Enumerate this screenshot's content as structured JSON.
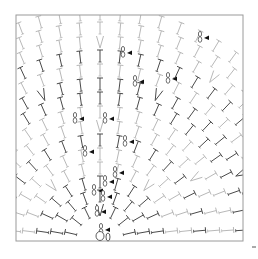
{
  "diagram": {
    "title": "Crochet stitch chart",
    "type": "radial crochet chart quarter",
    "frame": {
      "x": 16,
      "y": 15,
      "width": 227,
      "height": 226,
      "color": "#9a9a9a"
    },
    "center": {
      "x": 100,
      "y": 240
    },
    "colors": {
      "stitch_dark": "#4a4a4a",
      "stitch_light": "#b8b8b8",
      "marker": "#111111",
      "background": "#ffffff"
    },
    "rows": [
      {
        "radius": 24,
        "count": 7,
        "tone": "dark"
      },
      {
        "radius": 38,
        "count": 9,
        "tone": "dark"
      },
      {
        "radius": 52,
        "count": 11,
        "tone": "dark"
      },
      {
        "radius": 66,
        "count": 13,
        "tone": "light"
      },
      {
        "radius": 80,
        "count": 15,
        "tone": "light"
      },
      {
        "radius": 94,
        "count": 17,
        "tone": "dark"
      },
      {
        "radius": 108,
        "count": 19,
        "tone": "light"
      },
      {
        "radius": 122,
        "count": 21,
        "tone": "light"
      },
      {
        "radius": 136,
        "count": 23,
        "tone": "dark"
      },
      {
        "radius": 150,
        "count": 25,
        "tone": "dark"
      },
      {
        "radius": 164,
        "count": 27,
        "tone": "light"
      },
      {
        "radius": 178,
        "count": 29,
        "tone": "dark"
      },
      {
        "radius": 192,
        "count": 31,
        "tone": "light"
      },
      {
        "radius": 206,
        "count": 33,
        "tone": "light"
      },
      {
        "radius": 220,
        "count": 35,
        "tone": "light"
      }
    ],
    "symbols": {
      "stitch": "T",
      "increase": "V",
      "cluster": "8",
      "marker": "triangle-left"
    },
    "markers": [
      {
        "x": 128,
        "y": 52
      },
      {
        "x": 205,
        "y": 37
      },
      {
        "x": 173,
        "y": 78
      },
      {
        "x": 140,
        "y": 81
      },
      {
        "x": 80,
        "y": 118
      },
      {
        "x": 110,
        "y": 118
      },
      {
        "x": 130,
        "y": 141
      },
      {
        "x": 90,
        "y": 151
      },
      {
        "x": 120,
        "y": 172
      },
      {
        "x": 110,
        "y": 181
      },
      {
        "x": 99,
        "y": 190
      },
      {
        "x": 108,
        "y": 196
      },
      {
        "x": 102,
        "y": 211
      },
      {
        "x": 106,
        "y": 229
      }
    ],
    "center_ring": {
      "x": 100,
      "y": 236,
      "label": "0"
    },
    "stray_mark": {
      "x": 252,
      "y": 247
    }
  }
}
